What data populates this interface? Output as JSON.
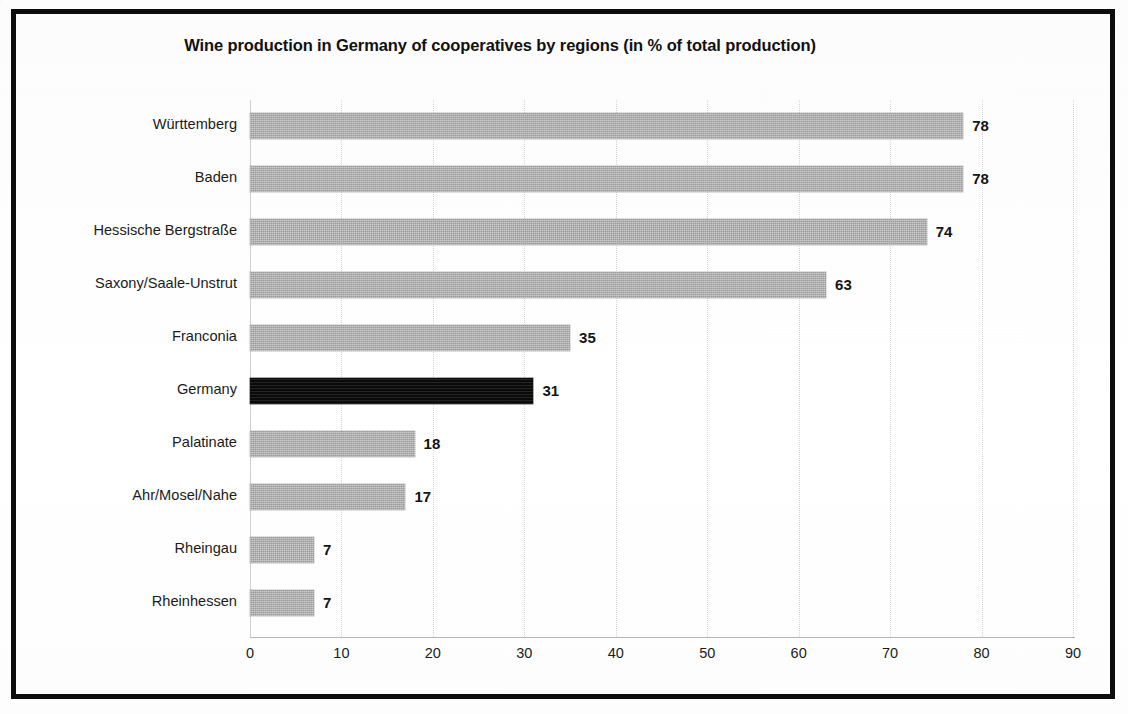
{
  "chart_data": {
    "type": "bar",
    "orientation": "horizontal",
    "title": "Wine production in Germany of cooperatives by regions (in % of total production)",
    "xlabel": "",
    "ylabel": "",
    "xlim": [
      0,
      90
    ],
    "xticks": [
      0,
      10,
      20,
      30,
      40,
      50,
      60,
      70,
      80,
      90
    ],
    "xtick_labels": [
      "0",
      "10",
      "20",
      "30",
      "40",
      "50",
      "60",
      "70",
      "80",
      "90"
    ],
    "grid": "vertical-dotted",
    "legend": "none",
    "value_labels": true,
    "categories": [
      "Württemberg",
      "Baden",
      "Hessische Bergstraße",
      "Saxony/Saale-Unstrut",
      "Franconia",
      "Germany",
      "Palatinate",
      "Ahr/Mosel/Nahe",
      "Rheingau",
      "Rheinhessen"
    ],
    "values": [
      78,
      78,
      74,
      63,
      35,
      31,
      18,
      17,
      7,
      7
    ],
    "value_label_texts": [
      "78",
      "78",
      "74",
      "63",
      "35",
      "31",
      "18",
      "17",
      "7",
      "7"
    ],
    "highlighted_category": "Germany",
    "colors": {
      "bar": "#9a9a9a",
      "bar_highlight": "#0b0b0b",
      "grid": "#d7d7d7",
      "axis": "#b6b6b6",
      "text": "#1b1b1b",
      "frame": "#0d0d0d",
      "background": "#ffffff"
    }
  }
}
